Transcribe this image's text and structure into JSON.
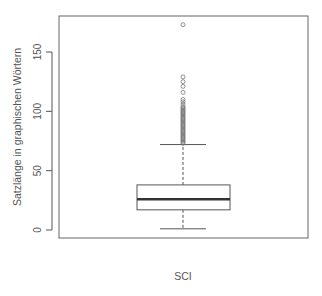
{
  "chart_data": {
    "type": "boxplot",
    "title": "",
    "xlabel": "SCI",
    "ylabel": "Satzlänge in graphischen Wörtern",
    "ylim": [
      -6,
      187
    ],
    "yticks": [
      0,
      50,
      100,
      150
    ],
    "ytick_labels": [
      "0",
      "50",
      "100",
      "150"
    ],
    "grid": false,
    "legend": null,
    "categories": [
      "SCI"
    ],
    "series": [
      {
        "name": "SCI",
        "whisker_low": 1,
        "q1": 17,
        "median": 26,
        "q3": 38,
        "whisker_high": 72,
        "outliers": [
          173,
          129,
          125,
          121,
          116,
          110,
          108,
          106,
          104,
          103,
          102,
          101,
          100,
          99,
          98,
          97,
          96,
          95,
          94,
          93,
          92,
          91,
          90,
          89,
          88,
          87,
          86,
          85,
          84,
          83,
          82,
          81,
          80,
          79,
          78,
          77,
          76,
          75,
          74,
          73
        ]
      }
    ]
  },
  "colors": {
    "axis": "#555555",
    "box": "#555555",
    "median": "#333333",
    "outlier": "#777777",
    "background": "#ffffff"
  }
}
